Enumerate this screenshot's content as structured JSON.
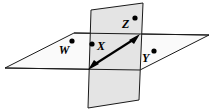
{
  "figure": {
    "width": 214,
    "height": 112,
    "background_color": "#ffffff"
  },
  "colors": {
    "vertical_plane_fill": "#e4e4e4",
    "horizontal_plane_fill": "#fafafa",
    "outline": "#1a1a1a",
    "arrow": "#000000",
    "dot": "#000000",
    "label_text": "#000000"
  },
  "planes": {
    "horizontal": {
      "name": "horizontal-plane",
      "fill": "#fafafa",
      "points": "5,68 74,33 209,35 140,70"
    },
    "vertical": {
      "name": "vertical-plane",
      "fill": "#e4e4e4",
      "points": "91,10 143,3 139,100 88,108"
    }
  },
  "intersection": {
    "name": "plane-intersection-line",
    "label": "line of intersection",
    "x1": 88,
    "y1": 70,
    "x2": 142,
    "y2": 34
  },
  "arrow": {
    "name": "double-headed-arrow",
    "label": "double-headed arrow",
    "shaft": {
      "x1": 92,
      "y1": 66,
      "x2": 136,
      "y2": 38
    },
    "head_start": "88,70 99,64 94,60",
    "head_end": "140,34 129,40 134,44"
  },
  "points": [
    {
      "id": "point-w",
      "label": "W",
      "dot": {
        "cx": 72,
        "cy": 41,
        "r": 2.6
      },
      "text": {
        "x": 64,
        "y": 54
      },
      "location": "horizontal-plane-left"
    },
    {
      "id": "point-x",
      "label": "X",
      "dot": {
        "cx": 92,
        "cy": 44,
        "r": 2.6
      },
      "text": {
        "x": 97,
        "y": 50
      },
      "location": "vertical-plane-left"
    },
    {
      "id": "point-z",
      "label": "Z",
      "dot": {
        "cx": 135,
        "cy": 18,
        "r": 2.6
      },
      "text": {
        "x": 122,
        "y": 28
      },
      "location": "vertical-plane-upper"
    },
    {
      "id": "point-y",
      "label": "Y",
      "dot": {
        "cx": 154,
        "cy": 51,
        "r": 2.6
      },
      "text": {
        "x": 142,
        "y": 62
      },
      "location": "horizontal-plane-right"
    }
  ]
}
